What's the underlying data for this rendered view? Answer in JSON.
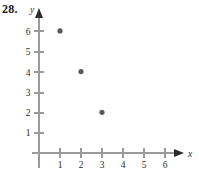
{
  "exercise": {
    "number_label": "28."
  },
  "colors": {
    "axis": "#9a9a9a",
    "arrow": "#2b2b2b",
    "text": "#2b2b2b",
    "point": "#595959",
    "background": "#ffffff"
  },
  "chart_data": {
    "type": "scatter",
    "title": "",
    "xlabel": "x",
    "ylabel": "y",
    "xlim": [
      0,
      6.8
    ],
    "ylim": [
      0,
      6.8
    ],
    "xticks": [
      1,
      2,
      3,
      4,
      5,
      6
    ],
    "xtick_labels": [
      "1",
      "2",
      "3",
      "4",
      "5",
      "6"
    ],
    "yticks": [
      1,
      2,
      3,
      4,
      5,
      6
    ],
    "ytick_labels": [
      "1",
      "2",
      "3",
      "4",
      "5",
      "6"
    ],
    "grid": false,
    "legend": null,
    "series": [
      {
        "name": "points",
        "marker": "filled-circle",
        "points": [
          {
            "x": 1,
            "y": 6
          },
          {
            "x": 2,
            "y": 4
          },
          {
            "x": 3,
            "y": 2
          }
        ]
      }
    ]
  },
  "axes": {
    "x_axis_name": "x",
    "y_axis_name": "y"
  }
}
